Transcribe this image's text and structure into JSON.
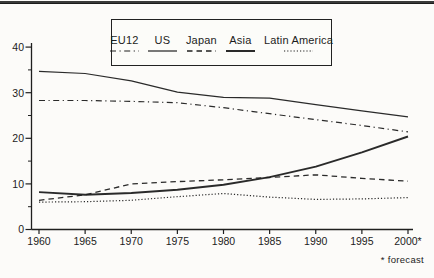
{
  "figure": {
    "kind": "scanned-line-chart"
  },
  "colors": {
    "ink": "#1f1f1f",
    "rule": "#3a3a3a",
    "background": "#fcfbf9"
  },
  "chart_data": {
    "type": "line",
    "title": "",
    "xlabel": "",
    "ylabel": "",
    "grid": false,
    "legend_position": "top-center-box",
    "footnote": "* forecast",
    "x": [
      1960,
      1965,
      1970,
      1975,
      1980,
      1985,
      1990,
      1995,
      2000
    ],
    "x_tick_labels": [
      "1960",
      "1965",
      "1970",
      "1975",
      "1980",
      "1985",
      "1990",
      "1995",
      "2000*"
    ],
    "y_ticks": [
      0,
      10,
      20,
      30,
      40
    ],
    "y_tick_labels": [
      "0",
      "10",
      "20",
      "30",
      "40"
    ],
    "y_minor_ticks": [
      5,
      15,
      25,
      35
    ],
    "ylim": [
      0,
      41
    ],
    "series": [
      {
        "name": "EU12",
        "line_style": "dash-dot",
        "values": [
          28.3,
          28.3,
          28.1,
          27.8,
          26.7,
          25.4,
          24.1,
          22.8,
          21.4
        ]
      },
      {
        "name": "US",
        "line_style": "solid",
        "values": [
          34.7,
          34.2,
          32.6,
          30.1,
          29.0,
          28.8,
          27.4,
          26.0,
          24.7
        ]
      },
      {
        "name": "Japan",
        "line_style": "dashed",
        "values": [
          6.4,
          7.6,
          10.0,
          10.5,
          10.9,
          11.4,
          12.0,
          11.2,
          10.6
        ]
      },
      {
        "name": "Asia",
        "line_style": "solid-bold",
        "values": [
          8.2,
          7.6,
          8.0,
          8.7,
          9.8,
          11.5,
          13.8,
          16.9,
          20.4
        ]
      },
      {
        "name": "Latin America",
        "line_style": "dotted",
        "values": [
          6.0,
          6.1,
          6.4,
          7.2,
          7.9,
          7.1,
          6.6,
          6.7,
          7.0
        ]
      }
    ]
  }
}
